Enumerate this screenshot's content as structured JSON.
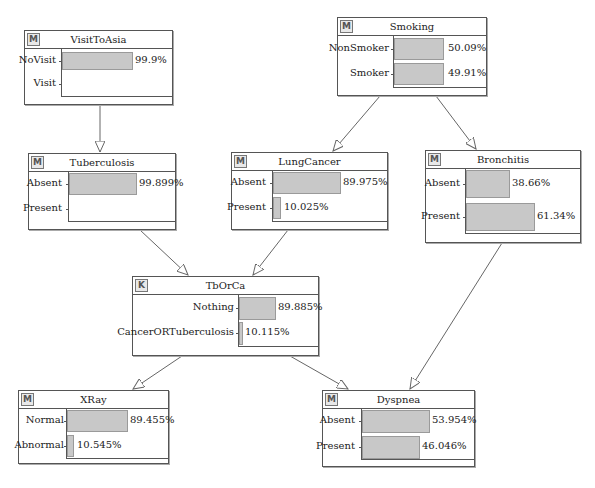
{
  "diagram": {
    "type": "bayesian-network",
    "edges": [
      {
        "from": "VisitToAsia",
        "to": "Tuberculosis"
      },
      {
        "from": "Smoking",
        "to": "LungCancer"
      },
      {
        "from": "Smoking",
        "to": "Bronchitis"
      },
      {
        "from": "Tuberculosis",
        "to": "TbOrCa"
      },
      {
        "from": "LungCancer",
        "to": "TbOrCa"
      },
      {
        "from": "TbOrCa",
        "to": "XRay"
      },
      {
        "from": "TbOrCa",
        "to": "Dyspnea"
      },
      {
        "from": "Bronchitis",
        "to": "Dyspnea"
      }
    ]
  },
  "nodes": {
    "visittoasia": {
      "badge": "M",
      "title": "VisitToAsia",
      "states": [
        {
          "label": "NoVisit",
          "pct": "99.9%",
          "value": 99.9
        },
        {
          "label": "Visit",
          "pct": "",
          "value": 0.1
        }
      ]
    },
    "smoking": {
      "badge": "M",
      "title": "Smoking",
      "states": [
        {
          "label": "NonSmoker",
          "pct": "50.09%",
          "value": 50.09
        },
        {
          "label": "Smoker",
          "pct": "49.91%",
          "value": 49.91
        }
      ]
    },
    "tuberculosis": {
      "badge": "M",
      "title": "Tuberculosis",
      "states": [
        {
          "label": "Absent",
          "pct": "99.899%",
          "value": 99.899
        },
        {
          "label": "Present",
          "pct": "",
          "value": 0.101
        }
      ]
    },
    "lungcancer": {
      "badge": "M",
      "title": "LungCancer",
      "states": [
        {
          "label": "Absent",
          "pct": "89.975%",
          "value": 89.975
        },
        {
          "label": "Present",
          "pct": "10.025%",
          "value": 10.025
        }
      ]
    },
    "bronchitis": {
      "badge": "M",
      "title": "Bronchitis",
      "states": [
        {
          "label": "Absent",
          "pct": "38.66%",
          "value": 38.66
        },
        {
          "label": "Present",
          "pct": "61.34%",
          "value": 61.34
        }
      ]
    },
    "tborca": {
      "badge": "K",
      "title": "TbOrCa",
      "states": [
        {
          "label": "Nothing",
          "pct": "89.885%",
          "value": 89.885
        },
        {
          "label": "CancerORTuberculosis",
          "pct": "10.115%",
          "value": 10.115
        }
      ]
    },
    "xray": {
      "badge": "M",
      "title": "XRay",
      "states": [
        {
          "label": "Normal",
          "pct": "89.455%",
          "value": 89.455
        },
        {
          "label": "Abnormal",
          "pct": "10.545%",
          "value": 10.545
        }
      ]
    },
    "dyspnea": {
      "badge": "M",
      "title": "Dyspnea",
      "states": [
        {
          "label": "Absent",
          "pct": "53.954%",
          "value": 53.954
        },
        {
          "label": "Present",
          "pct": "46.046%",
          "value": 46.046
        }
      ]
    }
  },
  "colors": {
    "bar_fill": "#c8c8c8",
    "bar_border": "#9a9a9a",
    "node_border": "#555555",
    "edge": "#666666"
  }
}
